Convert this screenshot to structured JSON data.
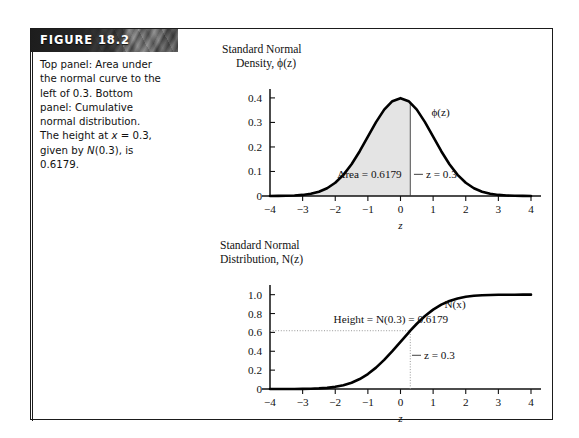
{
  "figure": {
    "label": "FIGURE 18.2",
    "caption_lines": [
      "Top panel: Area under",
      "the normal curve to the",
      "left of 0.3. Bottom",
      "panel: Cumulative",
      "normal distribution.",
      "The height at x = 0.3,",
      "given by N(0.3), is",
      "0.6179."
    ],
    "caption_text": "Top panel: Area under the normal curve to the left of 0.3. Bottom panel: Cumulative normal distribution. The height at x = 0.3, given by N(0.3), is 0.6179.",
    "banner_color": "#3d3d3d",
    "frame_color": "#1b1b1b"
  },
  "chart_data": [
    {
      "type": "line",
      "id": "standard-normal-density",
      "title": "Standard Normal Density, ϕ(z)",
      "title_line1": "Standard Normal",
      "title_line2": "Density, ϕ(z)",
      "xlabel": "z",
      "ylabel": "",
      "xlim": [
        -4,
        4
      ],
      "ylim": [
        0,
        0.42
      ],
      "xticks": [
        -4,
        -3,
        -2,
        -1,
        0,
        1,
        2,
        3,
        4
      ],
      "xticklabels": [
        "−4",
        "−3",
        "−2",
        "−1",
        "0",
        "1",
        "2",
        "3",
        "4"
      ],
      "yticks": [
        0,
        0.1,
        0.2,
        0.3,
        0.4
      ],
      "yticklabels": [
        "0",
        "0.1",
        "0.2",
        "0.3",
        "0.4"
      ],
      "grid": false,
      "curve_label": "ϕ(z)",
      "curve_label_x": 0.95,
      "curve_label_y": 0.325,
      "fill": {
        "from": -4,
        "to": 0.3,
        "color": "#e4e4e4",
        "label": "Area = 0.6179",
        "label_x": -0.95,
        "label_y": 0.072
      },
      "marker_line": {
        "x": 0.3,
        "label": "z = 0.3",
        "label_x": 0.78,
        "label_y": 0.072
      },
      "series": [
        {
          "name": "ϕ(z)",
          "x": [
            -4,
            -3.75,
            -3.5,
            -3.25,
            -3,
            -2.75,
            -2.5,
            -2.25,
            -2,
            -1.75,
            -1.5,
            -1.25,
            -1,
            -0.75,
            -0.5,
            -0.25,
            0,
            0.25,
            0.5,
            0.75,
            1,
            1.25,
            1.5,
            1.75,
            2,
            2.25,
            2.5,
            2.75,
            3,
            3.25,
            3.5,
            3.75,
            4
          ],
          "y": [
            0.0001,
            0.0004,
            0.0009,
            0.002,
            0.0044,
            0.0091,
            0.0175,
            0.0317,
            0.054,
            0.0863,
            0.1295,
            0.1826,
            0.242,
            0.3011,
            0.3521,
            0.3867,
            0.3989,
            0.3867,
            0.3521,
            0.3011,
            0.242,
            0.1826,
            0.1295,
            0.0863,
            0.054,
            0.0317,
            0.0175,
            0.0091,
            0.0044,
            0.002,
            0.0009,
            0.0004,
            0.0001
          ]
        }
      ]
    },
    {
      "type": "line",
      "id": "standard-normal-distribution",
      "title": "Standard Normal Distribution, N(z)",
      "title_line1": "Standard Normal",
      "title_line2": "Distribution, N(z)",
      "xlabel": "z",
      "ylabel": "",
      "xlim": [
        -4,
        4
      ],
      "ylim": [
        0,
        1.06
      ],
      "xticks": [
        -4,
        -3,
        -2,
        -1,
        0,
        1,
        2,
        3,
        4
      ],
      "xticklabels": [
        "−4",
        "−3",
        "−2",
        "−1",
        "0",
        "1",
        "2",
        "3",
        "4"
      ],
      "yticks": [
        0,
        0.2,
        0.4,
        0.6,
        0.8,
        1.0
      ],
      "yticklabels": [
        "0",
        "0.2",
        "0.4",
        "0.6",
        "0.8",
        "1.0"
      ],
      "grid": false,
      "curve_label": "N(x)",
      "curve_label_x": 1.35,
      "curve_label_y": 0.855,
      "height_line": {
        "y": 0.6179,
        "label": "Height = N(0.3) = 0.6179",
        "label_x": -2.05,
        "label_y": 0.7
      },
      "marker_line": {
        "x": 0.3,
        "label": "z = 0.3",
        "label_x": 0.72,
        "label_y": 0.315
      },
      "series": [
        {
          "name": "N(z)",
          "x": [
            -4,
            -3.75,
            -3.5,
            -3.25,
            -3,
            -2.75,
            -2.5,
            -2.25,
            -2,
            -1.75,
            -1.5,
            -1.25,
            -1,
            -0.75,
            -0.5,
            -0.25,
            0,
            0.25,
            0.3,
            0.5,
            0.75,
            1,
            1.25,
            1.5,
            1.75,
            2,
            2.25,
            2.5,
            2.75,
            3,
            3.25,
            3.5,
            3.75,
            4
          ],
          "y": [
            3e-05,
            0.0001,
            0.0002,
            0.0006,
            0.0013,
            0.003,
            0.0062,
            0.0122,
            0.0228,
            0.0401,
            0.0668,
            0.1056,
            0.1587,
            0.2266,
            0.3085,
            0.4013,
            0.5,
            0.5987,
            0.6179,
            0.6915,
            0.7734,
            0.8413,
            0.8944,
            0.9332,
            0.9599,
            0.9772,
            0.9878,
            0.9938,
            0.997,
            0.9987,
            0.9994,
            0.9998,
            0.9999,
            0.99997
          ]
        }
      ]
    }
  ]
}
